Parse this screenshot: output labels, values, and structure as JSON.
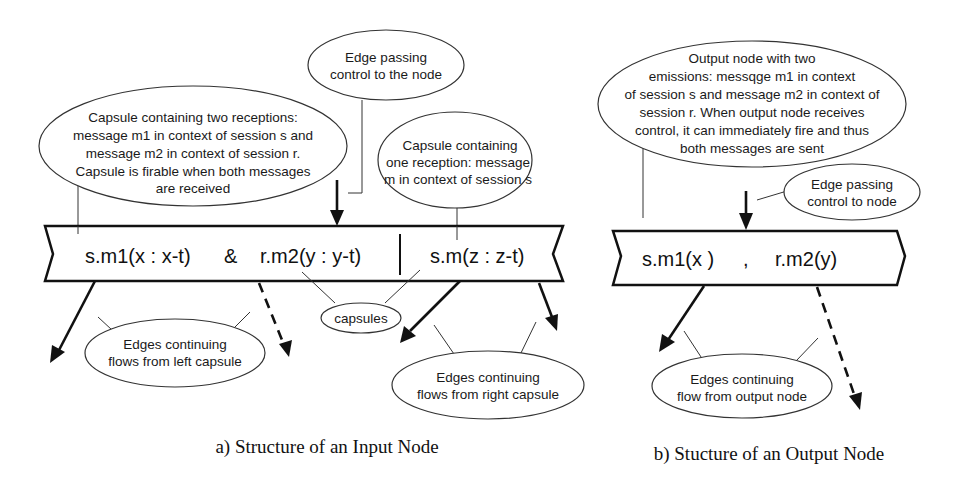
{
  "input_node": {
    "capsule_left": {
      "reception1": "s.m1(x : x-t)",
      "operator": "&",
      "reception2": "r.m2(y : y-t)"
    },
    "capsule_right": {
      "reception": "s.m(z : z-t)"
    },
    "annotations": {
      "edge_in": [
        "Edge passing",
        "control to the node"
      ],
      "left_capsule": [
        "Capsule containing two receptions:",
        "message m1 in context of session s and",
        "message m2 in context  of session r.",
        "Capsule is firable when both messages",
        "are received"
      ],
      "right_capsule": [
        "Capsule containing",
        "one reception: message",
        "m in context of session s"
      ],
      "capsules": [
        "capsules"
      ],
      "left_edges": [
        "Edges continuing",
        "flows from left capsule"
      ],
      "right_edges": [
        "Edges continuing",
        "flows from right capsule"
      ]
    },
    "caption": "a) Structure of an Input Node"
  },
  "output_node": {
    "emission1": "s.m1(x )",
    "separator": ",",
    "emission2": "r.m2(y)",
    "annotations": {
      "node": [
        "Output node with two",
        "emissions: messqge m1 in context",
        "of session s and message m2 in context of",
        "session r. When output node receives",
        "control, it can immediately fire and thus",
        "both messages are sent"
      ],
      "edge_in": [
        "Edge passing",
        "control to node"
      ],
      "edges_out": [
        "Edges continuing",
        "flow from output node"
      ]
    },
    "caption": "b) Stucture of an Output Node"
  }
}
